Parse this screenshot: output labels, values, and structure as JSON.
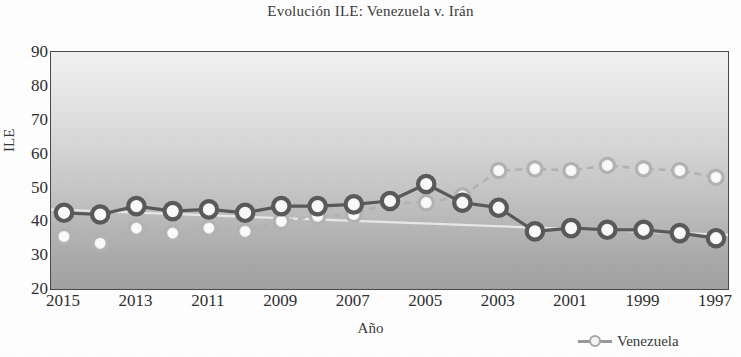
{
  "chart_data": {
    "type": "line",
    "title": "Evolución ILE: Venezuela v. Irán",
    "xlabel": "Año",
    "ylabel": "ILE",
    "categories": [
      2015,
      2014,
      2013,
      2012,
      2011,
      2010,
      2009,
      2008,
      2007,
      2006,
      2005,
      2004,
      2003,
      2002,
      2001,
      2000,
      1999,
      1998,
      1997
    ],
    "x_tick_labels": [
      "2015",
      "2013",
      "2011",
      "2009",
      "2007",
      "2005",
      "2003",
      "2001",
      "1999",
      "1997"
    ],
    "y_tick_labels": [
      "90",
      "80",
      "70",
      "60",
      "50",
      "40",
      "30",
      "20"
    ],
    "ylim": [
      20,
      90
    ],
    "y_major_step": 10,
    "grid": false,
    "legend_position": "bottom-right",
    "series": [
      {
        "name": "Venezuela",
        "color": "#f2f2f2",
        "line_color": "#b3b3b3",
        "marker": "circle",
        "values": [
          35.5,
          33.5,
          38.0,
          36.5,
          38.0,
          37.0,
          40.0,
          41.5,
          42.0,
          45.5,
          45.5,
          47.5,
          55.0,
          55.5,
          55.0,
          56.5,
          55.5,
          55.0,
          53.0
        ]
      },
      {
        "name": "Irán",
        "color": "#f7f7f7",
        "line_color": "#5a5a5a",
        "marker": "circle",
        "values": [
          42.5,
          42.0,
          44.5,
          43.0,
          43.5,
          42.5,
          44.5,
          44.5,
          45.0,
          46.0,
          51.0,
          45.5,
          44.0,
          37.0,
          38.0,
          37.5,
          37.5,
          36.5,
          35.0
        ]
      }
    ],
    "trend_line": {
      "name": "trend",
      "color": "#e8e8e8",
      "start_value": 43.5,
      "end_value": 36.0
    },
    "legend_entries": [
      "Venezuela"
    ]
  }
}
